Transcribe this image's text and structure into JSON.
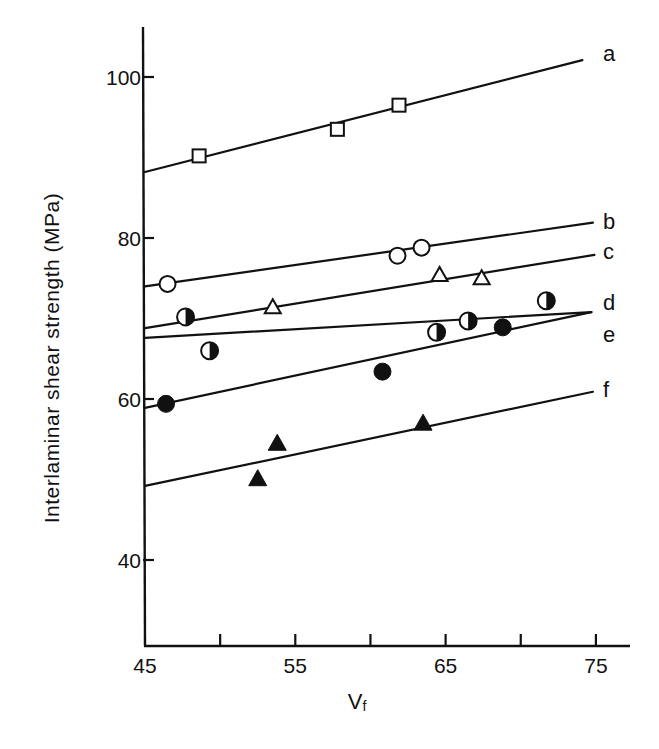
{
  "chart_data": {
    "type": "scatter",
    "title": "",
    "xlabel": "Vf",
    "xlabel_main": "V",
    "xlabel_sub": "f",
    "ylabel": "Interlaminar shear strength (MPa)",
    "xlim": [
      45,
      77
    ],
    "ylim": [
      29,
      106
    ],
    "x_ticks": [
      45,
      50,
      55,
      60,
      65,
      70,
      75
    ],
    "x_tick_labels": [
      "45",
      "",
      "55",
      "",
      "65",
      "",
      "75"
    ],
    "y_ticks": [
      40,
      60,
      80,
      100
    ],
    "y_tick_labels": [
      "40",
      "60",
      "80",
      "100"
    ],
    "grid": false,
    "legend": "inline labels at right end of each fitted line",
    "series": [
      {
        "name": "a",
        "marker": "open-square",
        "points": [
          [
            48.6,
            90.2
          ],
          [
            57.8,
            93.5
          ],
          [
            61.9,
            96.5
          ]
        ],
        "fit_line": [
          [
            45,
            88.2
          ],
          [
            74.1,
            102.1
          ]
        ]
      },
      {
        "name": "b",
        "marker": "open-circle",
        "points": [
          [
            46.5,
            74.3
          ],
          [
            61.8,
            77.8
          ],
          [
            63.4,
            78.8
          ]
        ],
        "fit_line": [
          [
            45,
            74.0
          ],
          [
            74.8,
            81.9
          ]
        ]
      },
      {
        "name": "c",
        "marker": "open-triangle",
        "points": [
          [
            53.5,
            71.4
          ],
          [
            64.6,
            75.4
          ],
          [
            67.4,
            75.0
          ]
        ],
        "fit_line": [
          [
            45,
            68.8
          ],
          [
            74.9,
            77.9
          ]
        ]
      },
      {
        "name": "d",
        "marker": "half-filled-circle",
        "points": [
          [
            47.7,
            70.2
          ],
          [
            49.3,
            66.0
          ],
          [
            64.4,
            68.3
          ],
          [
            66.5,
            69.7
          ],
          [
            71.7,
            72.2
          ]
        ],
        "fit_line": [
          [
            45,
            67.6
          ],
          [
            74.7,
            70.8
          ]
        ]
      },
      {
        "name": "e",
        "marker": "filled-circle",
        "points": [
          [
            46.4,
            59.4
          ],
          [
            60.8,
            63.4
          ],
          [
            68.8,
            68.9
          ]
        ],
        "fit_line": [
          [
            45,
            58.9
          ],
          [
            74.7,
            70.8
          ]
        ]
      },
      {
        "name": "f",
        "marker": "filled-triangle",
        "points": [
          [
            52.5,
            50.1
          ],
          [
            53.8,
            54.5
          ],
          [
            63.5,
            57.0
          ]
        ],
        "fit_line": [
          [
            45,
            49.2
          ],
          [
            74.8,
            60.9
          ]
        ]
      }
    ],
    "series_label_positions": {
      "a": 102.8,
      "b": 82.0,
      "c": 78.3,
      "d": 71.9,
      "e": 67.9,
      "f": 61.1
    }
  },
  "colors": {
    "ink": "#111111",
    "background": "#ffffff"
  }
}
